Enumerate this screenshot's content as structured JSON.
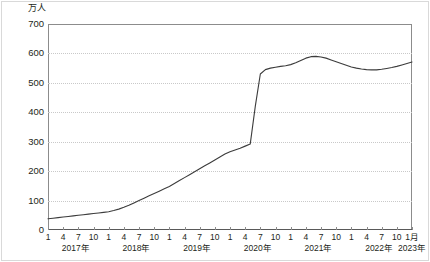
{
  "unit_label": "万人",
  "chart_data": {
    "type": "line",
    "title": "",
    "subtitle": "",
    "xlabel": "",
    "ylabel": "万人",
    "ylim": [
      0,
      700
    ],
    "yticks": [
      0,
      100,
      200,
      300,
      400,
      500,
      600,
      700
    ],
    "ytick_labels": [
      "0",
      "100",
      "200",
      "300",
      "400",
      "500",
      "600",
      "700"
    ],
    "grid": true,
    "legend": "none",
    "line_color": "#3c3c3c",
    "x_month_ticks": [
      "1",
      "4",
      "7",
      "10",
      "1",
      "4",
      "7",
      "10",
      "1",
      "4",
      "7",
      "10",
      "1",
      "4",
      "7",
      "10",
      "1",
      "4",
      "7",
      "10",
      "1",
      "4",
      "7",
      "10",
      "1月"
    ],
    "x_year_labels": [
      "2017年",
      "2018年",
      "2019年",
      "2020年",
      "2021年",
      "2022年",
      "2023年"
    ],
    "x": [
      "2017-01",
      "2017-02",
      "2017-03",
      "2017-04",
      "2017-05",
      "2017-06",
      "2017-07",
      "2017-08",
      "2017-09",
      "2017-10",
      "2017-11",
      "2017-12",
      "2018-01",
      "2018-02",
      "2018-03",
      "2018-04",
      "2018-05",
      "2018-06",
      "2018-07",
      "2018-08",
      "2018-09",
      "2018-10",
      "2018-11",
      "2018-12",
      "2019-01",
      "2019-02",
      "2019-03",
      "2019-04",
      "2019-05",
      "2019-06",
      "2019-07",
      "2019-08",
      "2019-09",
      "2019-10",
      "2019-11",
      "2019-12",
      "2020-01",
      "2020-02",
      "2020-03",
      "2020-04",
      "2020-05",
      "2020-06",
      "2020-07",
      "2020-08",
      "2020-09",
      "2020-10",
      "2020-11",
      "2020-12",
      "2021-01",
      "2021-02",
      "2021-03",
      "2021-04",
      "2021-05",
      "2021-06",
      "2021-07",
      "2021-08",
      "2021-09",
      "2021-10",
      "2021-11",
      "2021-12",
      "2022-01",
      "2022-02",
      "2022-03",
      "2022-04",
      "2022-05",
      "2022-06",
      "2022-07",
      "2022-08",
      "2022-09",
      "2022-10",
      "2022-11",
      "2022-12",
      "2023-01"
    ],
    "values": [
      38,
      40,
      42,
      44,
      46,
      48,
      50,
      52,
      54,
      56,
      58,
      60,
      62,
      66,
      71,
      77,
      84,
      92,
      100,
      108,
      116,
      124,
      132,
      140,
      148,
      158,
      168,
      178,
      188,
      198,
      208,
      218,
      228,
      238,
      248,
      258,
      266,
      272,
      278,
      285,
      292,
      420,
      530,
      545,
      550,
      553,
      556,
      558,
      562,
      568,
      576,
      584,
      589,
      590,
      588,
      584,
      578,
      572,
      566,
      560,
      554,
      550,
      547,
      545,
      544,
      544,
      546,
      549,
      552,
      556,
      561,
      566,
      571
    ]
  }
}
